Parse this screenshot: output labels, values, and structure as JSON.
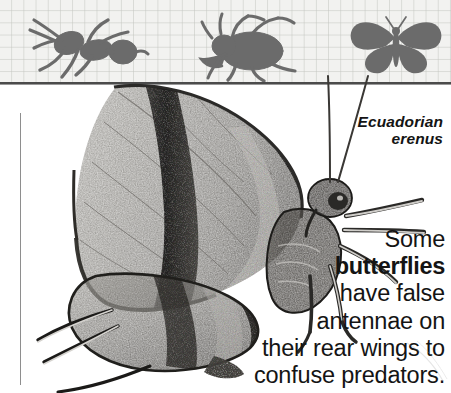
{
  "page": {
    "width": 451,
    "height": 393,
    "background_color": "#ffffff",
    "band_background_color": "#f2f2f0",
    "silhouette_color": "#6b6b6b",
    "rule_color": "#4b4b4b",
    "text_color": "#141414"
  },
  "silhouette_band": {
    "name": "insect-silhouette-strip",
    "items": [
      {
        "icon": "ant-silhouette-icon",
        "label": "ant"
      },
      {
        "icon": "fly-silhouette-icon",
        "label": "fly"
      },
      {
        "icon": "butterfly-silhouette-icon",
        "label": "butterfly"
      }
    ]
  },
  "photo": {
    "name": "butterfly-photograph",
    "subject": "butterfly with false antennae on rear wings",
    "alt": "Ecuadorian erenus butterfly side view"
  },
  "species_label": {
    "line1": "Ecuadorian",
    "line2": "erenus",
    "full": "Ecuadorian\nerenus"
  },
  "caption": {
    "lines": [
      {
        "text": "Some",
        "bold": false
      },
      {
        "text": "butterflies",
        "bold": true
      },
      {
        "text": "have false",
        "bold": false
      },
      {
        "text": "antennae on",
        "bold": false
      },
      {
        "text": "their rear wings to",
        "bold": false
      },
      {
        "text": "confuse predators.",
        "bold": false
      }
    ],
    "line1": "Some",
    "line2": "butterflies",
    "line3": "have false",
    "line4": "antennae on",
    "line5": "their rear wings to",
    "line6": "confuse predators.",
    "full_text": "Some butterflies have false antennae on their rear wings to confuse predators."
  }
}
